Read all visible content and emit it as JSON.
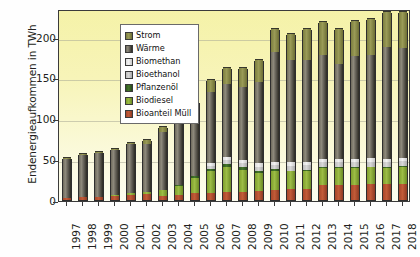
{
  "chart_data": {
    "type": "bar",
    "stacked": true,
    "title": "",
    "xlabel": "",
    "ylabel": "Endenergieaufkommen in TWh",
    "ylim": [
      0,
      235
    ],
    "yticks": [
      0,
      50,
      100,
      150,
      200
    ],
    "grid": true,
    "legend_position": "top-left",
    "categories": [
      "1997",
      "1998",
      "1999",
      "2000",
      "2001",
      "2002",
      "2003",
      "2004",
      "2005",
      "2006",
      "2007",
      "2008",
      "2009",
      "2010",
      "2011",
      "2012",
      "2013",
      "2014",
      "2015",
      "2016",
      "2017",
      "2018"
    ],
    "series": [
      {
        "name": "Bioanteil Müll",
        "color": "#b4512f",
        "values": [
          3,
          4,
          4,
          5,
          6,
          7,
          5,
          6,
          8,
          9,
          10,
          10,
          11,
          12,
          13,
          14,
          18,
          18,
          18,
          19,
          20,
          20
        ]
      },
      {
        "name": "Biodiesel",
        "color": "#8fae33",
        "values": [
          0,
          0,
          0,
          1,
          2,
          3,
          7,
          11,
          19,
          27,
          31,
          27,
          22,
          24,
          22,
          22,
          21,
          21,
          21,
          21,
          19,
          21
        ]
      },
      {
        "name": "Pflanzenöl",
        "color": "#386b23",
        "values": [
          0,
          0,
          0,
          0,
          0,
          0,
          0,
          1,
          2,
          2,
          3,
          3,
          3,
          2,
          1,
          1,
          1,
          1,
          1,
          1,
          1,
          1
        ]
      },
      {
        "name": "Bioethanol",
        "color": "#c6c6c6",
        "values": [
          0,
          0,
          0,
          0,
          0,
          0,
          0,
          0,
          1,
          4,
          5,
          5,
          5,
          5,
          6,
          6,
          6,
          6,
          6,
          6,
          6,
          6
        ]
      },
      {
        "name": "Biomethan",
        "color": "#e6e6e6",
        "values": [
          0,
          0,
          0,
          0,
          0,
          0,
          0,
          0,
          0,
          3,
          4,
          4,
          4,
          4,
          4,
          4,
          4,
          4,
          4,
          4,
          4,
          4
        ]
      },
      {
        "name": "Wärme",
        "color": "#6b675b",
        "values": [
          47,
          51,
          54,
          55,
          60,
          59,
          71,
          75,
          79,
          87,
          89,
          89,
          100,
          134,
          125,
          124,
          128,
          117,
          126,
          127,
          137,
          134
        ]
      },
      {
        "name": "Strom",
        "color": "#8b8d4b",
        "values": [
          1,
          1,
          1,
          1,
          2,
          4,
          6,
          7,
          11,
          15,
          19,
          23,
          26,
          28,
          32,
          38,
          40,
          42,
          43,
          44,
          43,
          44
        ]
      }
    ],
    "totals": [
      51,
      56,
      59,
      62,
      70,
      73,
      89,
      100,
      120,
      147,
      161,
      161,
      171,
      207,
      203,
      209,
      218,
      209,
      219,
      222,
      230,
      230
    ]
  },
  "legend": {
    "items": [
      {
        "label": "Strom"
      },
      {
        "label": "Wärme"
      },
      {
        "label": "Biomethan"
      },
      {
        "label": "Bioethanol"
      },
      {
        "label": "Pflanzenöl"
      },
      {
        "label": "Biodiesel"
      },
      {
        "label": "Bioanteil Müll"
      }
    ]
  }
}
